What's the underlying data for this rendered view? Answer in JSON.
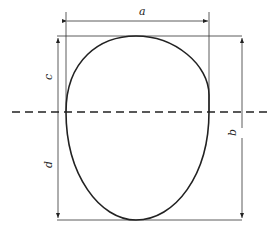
{
  "diagram": {
    "labels": {
      "a": "a",
      "b": "b",
      "c": "c",
      "d": "d"
    }
  }
}
